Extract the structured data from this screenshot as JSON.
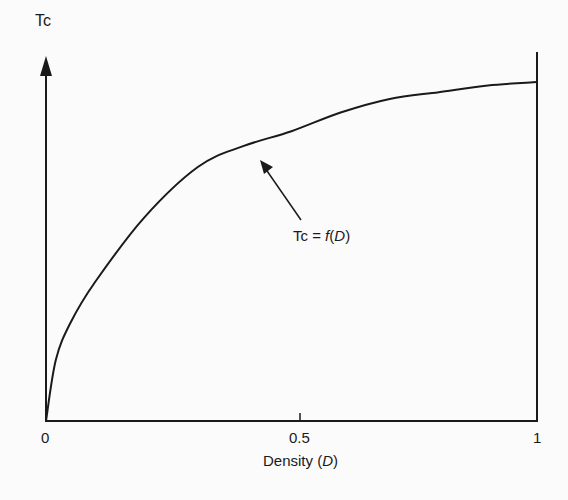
{
  "chart_data": {
    "type": "line",
    "title": "",
    "xlabel": "Density",
    "xlabel_var": "D",
    "ylabel": "Tc",
    "xticks": [
      "0",
      "0.5",
      "1"
    ],
    "xlim": [
      0,
      1
    ],
    "ylim": [
      0,
      1.1
    ],
    "grid": false,
    "legend": null,
    "series": [
      {
        "name": "Tc = f(D)",
        "x": [
          0,
          0.02,
          0.05,
          0.1,
          0.2,
          0.31,
          0.4,
          0.5,
          0.6,
          0.7,
          0.8,
          0.9,
          1.0
        ],
        "y": [
          0,
          0.18,
          0.29,
          0.41,
          0.6,
          0.75,
          0.81,
          0.855,
          0.91,
          0.95,
          0.97,
          0.99,
          1.0
        ]
      }
    ],
    "annotations": [
      {
        "text_prefix": "Tc = ",
        "text_func": "f",
        "text_open": "(",
        "text_var": "D",
        "text_close": ")",
        "arrow_to": [
          0.44,
          0.76
        ]
      }
    ]
  },
  "labels": {
    "ylabel": "Tc",
    "tick0": "0",
    "tick05": "0.5",
    "tick1": "1",
    "xlabel_prefix": "Density (",
    "xlabel_var": "D",
    "xlabel_suffix": ")",
    "annot_prefix": "Tc = ",
    "annot_func": "f",
    "annot_open": "(",
    "annot_var": "D",
    "annot_close": ")"
  }
}
